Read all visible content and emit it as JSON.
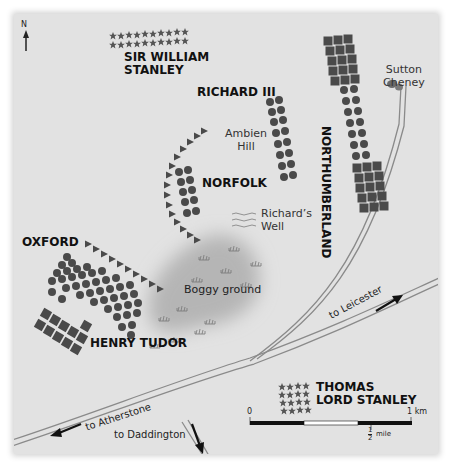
{
  "map": {
    "compass": {
      "label": "N",
      "icon": "north-arrow-icon"
    },
    "armies": {
      "sir_william_stanley": {
        "name_line1": "SIR WILLIAM",
        "name_line2": "STANLEY",
        "symbol": "star"
      },
      "richard_iii": {
        "name": "RICHARD III",
        "symbol": "circle"
      },
      "northumberland": {
        "name": "NORTHUMBERLAND",
        "symbol": "square+circle"
      },
      "norfolk": {
        "name": "NORFOLK",
        "symbol": "circle+triangle"
      },
      "oxford": {
        "name": "OXFORD",
        "symbol": "circle+triangle"
      },
      "henry_tudor": {
        "name": "HENRY TUDOR",
        "symbol": "circle+square"
      },
      "thomas_lord_stanley": {
        "name_line1": "THOMAS",
        "name_line2": "LORD STANLEY",
        "symbol": "star"
      }
    },
    "places": {
      "ambien_hill": {
        "line1": "Ambien",
        "line2": "Hill"
      },
      "richards_well": {
        "line1": "Richard’s",
        "line2": "Well"
      },
      "boggy_ground": "Boggy ground",
      "sutton_cheney": {
        "line1": "Sutton",
        "line2": "Cheney"
      }
    },
    "roads": {
      "leicester": "to Leicester",
      "atherstone": "to Atherstone",
      "daddington": "to Daddington"
    },
    "scale": {
      "zero": "0",
      "km": "1 km",
      "half_num": "1",
      "half_den": "2",
      "mile": "mile"
    },
    "colors": {
      "background": "#e2e2e2",
      "unit": "#4a4a4a",
      "bog": "#b9b9b9",
      "road": "#888888"
    }
  }
}
